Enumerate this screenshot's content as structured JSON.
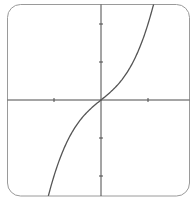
{
  "chart_data": {
    "type": "line",
    "title": "",
    "xlabel": "",
    "ylabel": "",
    "function": "y = x^3 + x",
    "xlim": [
      -2.0,
      1.9
    ],
    "ylim": [
      -2.5,
      2.5
    ],
    "x_ticks": [
      -1,
      1
    ],
    "y_ticks": [
      -2,
      -1,
      1,
      2
    ],
    "tick_labels_shown": false,
    "grid": false,
    "legend": null,
    "series": [
      {
        "name": "curve",
        "x": [
          -1.12,
          -1.0,
          -0.8,
          -0.6,
          -0.4,
          -0.2,
          0.0,
          0.2,
          0.4,
          0.6,
          0.8,
          1.0,
          1.12
        ],
        "values": [
          -2.52,
          -2.0,
          -1.312,
          -0.816,
          -0.464,
          -0.208,
          0.0,
          0.208,
          0.464,
          0.816,
          1.312,
          2.0,
          2.52
        ]
      }
    ],
    "colors": {
      "frame": "#9a9a9a",
      "axes": "#4a4a4a",
      "curve": "#555555"
    }
  }
}
